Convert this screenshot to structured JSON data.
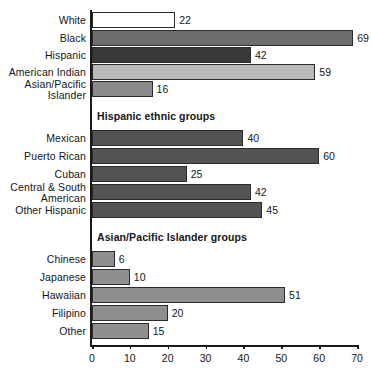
{
  "chart_data": {
    "type": "bar",
    "orientation": "horizontal",
    "title": "",
    "xlabel": "",
    "ylabel": "",
    "xlim": [
      0,
      70
    ],
    "xticks": [
      0,
      10,
      20,
      30,
      40,
      50,
      60,
      70
    ],
    "grid": false,
    "legend": null,
    "value_labels": true,
    "sections": [
      {
        "header": "",
        "categories": [
          "White",
          "Black",
          "Hispanic",
          "American Indian",
          "Asian/Pacific Islander"
        ],
        "values": [
          22,
          69,
          42,
          59,
          16
        ],
        "colors": [
          "#ffffff",
          "#6e6e6e",
          "#3a3a3a",
          "#b9b9b9",
          "#8a8a8a"
        ]
      },
      {
        "header": "Hispanic ethnic groups",
        "categories": [
          "Mexican",
          "Puerto Rican",
          "Cuban",
          "Central & South American",
          "Other Hispanic"
        ],
        "values": [
          40,
          60,
          25,
          42,
          45
        ],
        "colors": [
          "#545454",
          "#545454",
          "#545454",
          "#545454",
          "#545454"
        ]
      },
      {
        "header": "Asian/Pacific Islander groups",
        "categories": [
          "Chinese",
          "Japanese",
          "Hawaiian",
          "Filipino",
          "Other"
        ],
        "values": [
          6,
          10,
          51,
          20,
          15
        ],
        "colors": [
          "#8f8f8f",
          "#8f8f8f",
          "#8f8f8f",
          "#8f8f8f",
          "#8f8f8f"
        ]
      }
    ]
  },
  "rows": [
    {
      "label": "White",
      "label2": "",
      "value": 22,
      "color": "#ffffff",
      "top": 12
    },
    {
      "label": "Black",
      "label2": "",
      "value": 69,
      "color": "#6e6e6e",
      "top": 30
    },
    {
      "label": "Hispanic",
      "label2": "",
      "value": 42,
      "color": "#3a3a3a",
      "top": 47
    },
    {
      "label": "American Indian",
      "label2": "",
      "value": 59,
      "color": "#b9b9b9",
      "top": 64
    },
    {
      "label": "Asian/Pacific",
      "label2": "Islander",
      "value": 16,
      "color": "#8a8a8a",
      "top": 81
    },
    {
      "label": "Mexican",
      "label2": "",
      "value": 40,
      "color": "#545454",
      "top": 130
    },
    {
      "label": "Puerto Rican",
      "label2": "",
      "value": 60,
      "color": "#545454",
      "top": 148
    },
    {
      "label": "Cuban",
      "label2": "",
      "value": 25,
      "color": "#545454",
      "top": 166
    },
    {
      "label": "Central & South",
      "label2": "American",
      "value": 42,
      "color": "#545454",
      "top": 184
    },
    {
      "label": "Other Hispanic",
      "label2": "",
      "value": 45,
      "color": "#545454",
      "top": 202
    },
    {
      "label": "Chinese",
      "label2": "",
      "value": 6,
      "color": "#8f8f8f",
      "top": 251
    },
    {
      "label": "Japanese",
      "label2": "",
      "value": 10,
      "color": "#8f8f8f",
      "top": 269
    },
    {
      "label": "Hawaiian",
      "label2": "",
      "value": 51,
      "color": "#8f8f8f",
      "top": 287
    },
    {
      "label": "Filipino",
      "label2": "",
      "value": 20,
      "color": "#8f8f8f",
      "top": 305
    },
    {
      "label": "Other",
      "label2": "",
      "value": 15,
      "color": "#8f8f8f",
      "top": 323
    }
  ],
  "section_headers": [
    {
      "text": "Hispanic ethnic groups",
      "top": 110
    },
    {
      "text": "Asian/Pacific Islander groups",
      "top": 231
    }
  ],
  "axis": {
    "min": 0,
    "max": 70,
    "ticks": [
      "0",
      "10",
      "20",
      "30",
      "40",
      "50",
      "60",
      "70"
    ],
    "tick_values": [
      0,
      10,
      20,
      30,
      40,
      50,
      60,
      70
    ]
  }
}
